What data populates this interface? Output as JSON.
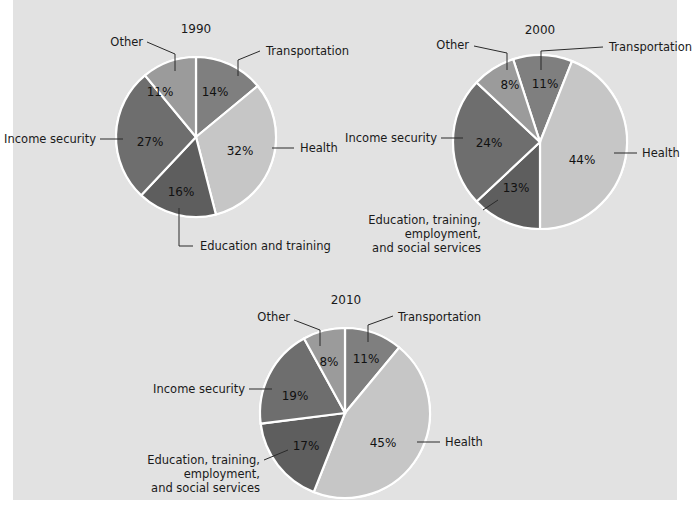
{
  "chart_data": [
    {
      "type": "pie",
      "title": "1990",
      "categories": [
        "Transportation",
        "Health",
        "Education and training",
        "Income security",
        "Other"
      ],
      "values": [
        14,
        32,
        16,
        27,
        11
      ],
      "value_labels": [
        "14%",
        "32%",
        "16%",
        "27%",
        "11%"
      ],
      "colors": [
        "#7f7f7f",
        "#c6c6c6",
        "#5e5e5e",
        "#6e6e6e",
        "#9b9b9b"
      ]
    },
    {
      "type": "pie",
      "title": "2000",
      "categories": [
        "Transportation",
        "Health",
        "Education, training, employment, and social services",
        "Income security",
        "Other"
      ],
      "values": [
        11,
        44,
        13,
        24,
        8
      ],
      "value_labels": [
        "11%",
        "44%",
        "13%",
        "24%",
        "8%"
      ],
      "colors": [
        "#7f7f7f",
        "#c6c6c6",
        "#5e5e5e",
        "#6e6e6e",
        "#9b9b9b"
      ]
    },
    {
      "type": "pie",
      "title": "2010",
      "categories": [
        "Transportation",
        "Health",
        "Education, training, employment, and social services",
        "Income security",
        "Other"
      ],
      "values": [
        11,
        45,
        17,
        19,
        8
      ],
      "value_labels": [
        "11%",
        "45%",
        "17%",
        "19%",
        "8%"
      ],
      "colors": [
        "#7f7f7f",
        "#c6c6c6",
        "#5e5e5e",
        "#6e6e6e",
        "#9b9b9b"
      ]
    }
  ],
  "charts": {
    "c1990": {
      "title": "1990",
      "labels": {
        "other": "Other",
        "transportation": "Transportation",
        "health": "Health",
        "income": "Income security",
        "education": "Education and training"
      },
      "pcts": {
        "other": "11%",
        "transportation": "14%",
        "health": "32%",
        "education": "16%",
        "income": "27%"
      }
    },
    "c2000": {
      "title": "2000",
      "labels": {
        "other": "Other",
        "transportation": "Transportation",
        "health": "Health",
        "income": "Income security",
        "education_1": "Education, training,",
        "education_2": "employment,",
        "education_3": "and social services"
      },
      "pcts": {
        "other": "8%",
        "transportation": "11%",
        "health": "44%",
        "education": "13%",
        "income": "24%"
      }
    },
    "c2010": {
      "title": "2010",
      "labels": {
        "other": "Other",
        "transportation": "Transportation",
        "health": "Health",
        "income": "Income security",
        "education_1": "Education, training,",
        "education_2": "employment,",
        "education_3": "and social services"
      },
      "pcts": {
        "other": "8%",
        "transportation": "11%",
        "health": "45%",
        "education": "17%",
        "income": "19%"
      }
    }
  }
}
